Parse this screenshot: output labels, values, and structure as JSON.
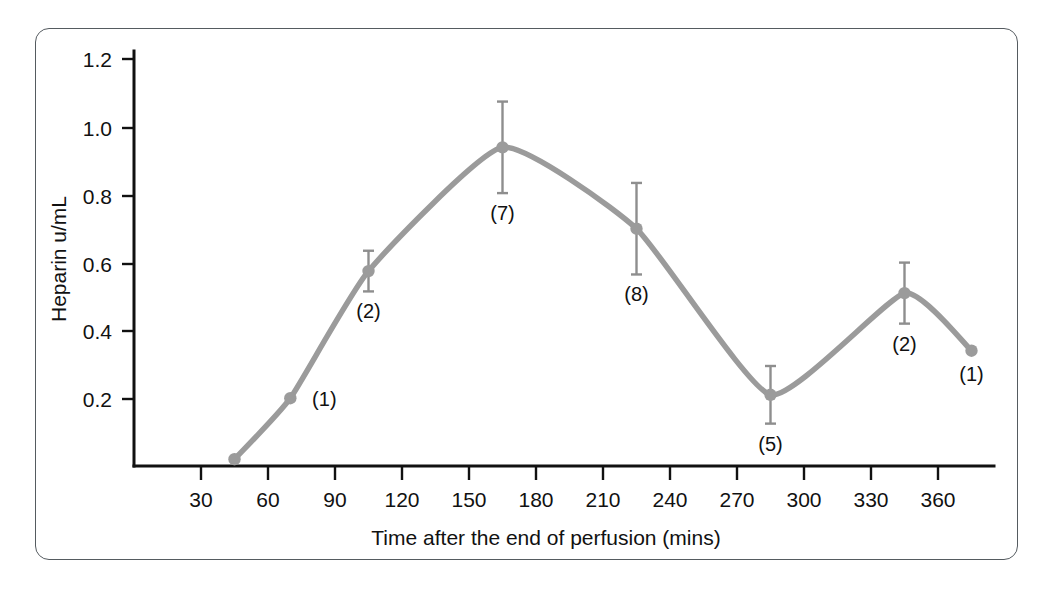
{
  "figure": {
    "border_color": "#555b60",
    "background": "#ffffff"
  },
  "chart_data": {
    "type": "line",
    "title": "",
    "xlabel": "Time after the end of perfusion (mins)",
    "ylabel": "Heparin u/mL",
    "xlim": [
      0,
      400
    ],
    "ylim": [
      0,
      1.28
    ],
    "xticks": [
      30,
      60,
      90,
      120,
      150,
      180,
      210,
      240,
      270,
      300,
      330,
      360
    ],
    "xtick_labels": [
      "30",
      "60",
      "90",
      "120",
      "150",
      "180",
      "210",
      "240",
      "270",
      "300",
      "330",
      "360"
    ],
    "yticks": [
      0.2,
      0.4,
      0.6,
      0.8,
      1.0,
      1.2
    ],
    "ytick_labels": [
      "0.2",
      "0.4",
      "0.6",
      "0.8",
      "1.0",
      "1.2"
    ],
    "grid": false,
    "legend": "none",
    "line_color": "#9b9b9b",
    "marker_color": "#9b9b9b",
    "errorbar_color": "#8e8e8e",
    "x": [
      45,
      70,
      105,
      165,
      225,
      285,
      345,
      375
    ],
    "values": [
      0.02,
      0.2,
      0.575,
      0.94,
      0.7,
      0.21,
      0.51,
      0.34
    ],
    "errors": [
      0.0,
      0.0,
      0.06,
      0.135,
      0.135,
      0.085,
      0.09,
      0.0
    ],
    "point_labels": [
      "",
      "(1)",
      "(2)",
      "(7)",
      "(8)",
      "(5)",
      "(2)",
      "(1)"
    ],
    "point_label_note": "Numbers in parentheses are the sample count (n) at each time point",
    "points": [
      {
        "x": 45,
        "y": 0.02,
        "err": 0.0,
        "label": ""
      },
      {
        "x": 70,
        "y": 0.2,
        "err": 0.0,
        "label": "(1)"
      },
      {
        "x": 105,
        "y": 0.575,
        "err": 0.06,
        "label": "(2)"
      },
      {
        "x": 165,
        "y": 0.94,
        "err": 0.135,
        "label": "(7)"
      },
      {
        "x": 225,
        "y": 0.7,
        "err": 0.135,
        "label": "(8)"
      },
      {
        "x": 285,
        "y": 0.21,
        "err": 0.085,
        "label": "(5)"
      },
      {
        "x": 345,
        "y": 0.51,
        "err": 0.09,
        "label": "(2)"
      },
      {
        "x": 375,
        "y": 0.34,
        "err": 0.0,
        "label": "(1)"
      }
    ]
  },
  "labels": {
    "y_axis_title": "Heparin u/mL",
    "x_axis_title": "Time after the end of perfusion (mins)",
    "y_0_2": "0.2",
    "y_0_4": "0.4",
    "y_0_6": "0.6",
    "y_0_8": "0.8",
    "y_1_0": "1.0",
    "y_1_2": "1.2",
    "x_30": "30",
    "x_60": "60",
    "x_90": "90",
    "x_120": "120",
    "x_150": "150",
    "x_180": "180",
    "x_210": "210",
    "x_240": "240",
    "x_270": "270",
    "x_300": "300",
    "x_330": "330",
    "x_360": "360",
    "n_45": "",
    "n_70": "(1)",
    "n_105": "(2)",
    "n_165": "(7)",
    "n_225": "(8)",
    "n_285": "(5)",
    "n_345": "(2)",
    "n_375": "(1)"
  }
}
